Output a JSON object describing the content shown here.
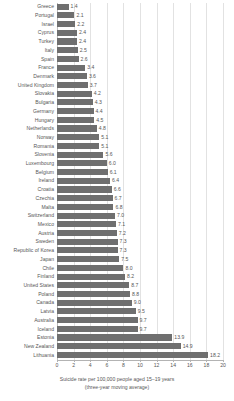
{
  "chart_data": {
    "type": "bar",
    "orientation": "horizontal",
    "title": "",
    "xlabel": "Suicide rate per 100,000 people aged 15–19 years",
    "xlabel_line2": "(three-year moving average)",
    "ylabel": "",
    "xlim": [
      0,
      20
    ],
    "xticks": [
      0,
      2,
      4,
      6,
      8,
      10,
      12,
      14,
      16,
      18,
      20
    ],
    "xtick_labels": [
      "0",
      "2",
      "4",
      "6",
      "8",
      "10",
      "12",
      "14",
      "16",
      "18",
      "20"
    ],
    "grid": "vertical",
    "legend": "none",
    "bar_color": "#6f6f6f",
    "grid_color": "#e2e2e2",
    "value_label_format": "one-decimal",
    "categories": [
      "Greece",
      "Portugal",
      "Israel",
      "Cyprus",
      "Turkey",
      "Italy",
      "Spain",
      "France",
      "Denmark",
      "United Kingdom",
      "Slovakia",
      "Bulgaria",
      "Germany",
      "Hungary",
      "Netherlands",
      "Norway",
      "Romania",
      "Slovenia",
      "Luxembourg",
      "Belgium",
      "Ireland",
      "Croatia",
      "Czechia",
      "Malta",
      "Switzerland",
      "Mexico",
      "Austria",
      "Sweden",
      "Republic of Korea",
      "Japan",
      "Chile",
      "Finland",
      "United States",
      "Poland",
      "Canada",
      "Latvia",
      "Australia",
      "Iceland",
      "Estonia",
      "New Zealand",
      "Lithuania"
    ],
    "values": [
      1.4,
      2.1,
      2.2,
      2.4,
      2.4,
      2.5,
      2.6,
      3.4,
      3.6,
      3.7,
      4.2,
      4.3,
      4.4,
      4.5,
      4.8,
      5.1,
      5.1,
      5.6,
      6.0,
      6.1,
      6.4,
      6.6,
      6.7,
      6.8,
      7.0,
      7.1,
      7.2,
      7.3,
      7.3,
      7.5,
      8.0,
      8.2,
      8.7,
      8.8,
      9.0,
      9.5,
      9.7,
      9.7,
      13.9,
      14.9,
      18.2
    ],
    "value_labels": [
      "1.4",
      "2.1",
      "2.2",
      "2.4",
      "2.4",
      "2.5",
      "2.6",
      "3.4",
      "3.6",
      "3.7",
      "4.2",
      "4.3",
      "4.4",
      "4.5",
      "4.8",
      "5.1",
      "5.1",
      "5.6",
      "6.0",
      "6.1",
      "6.4",
      "6.6",
      "6.7",
      "6.8",
      "7.0",
      "7.1",
      "7.2",
      "7.3",
      "7.3",
      "7.5",
      "8.0",
      "8.2",
      "8.7",
      "8.8",
      "9.0",
      "9.5",
      "9.7",
      "9.7",
      "13.9",
      "14.9",
      "18.2"
    ]
  }
}
